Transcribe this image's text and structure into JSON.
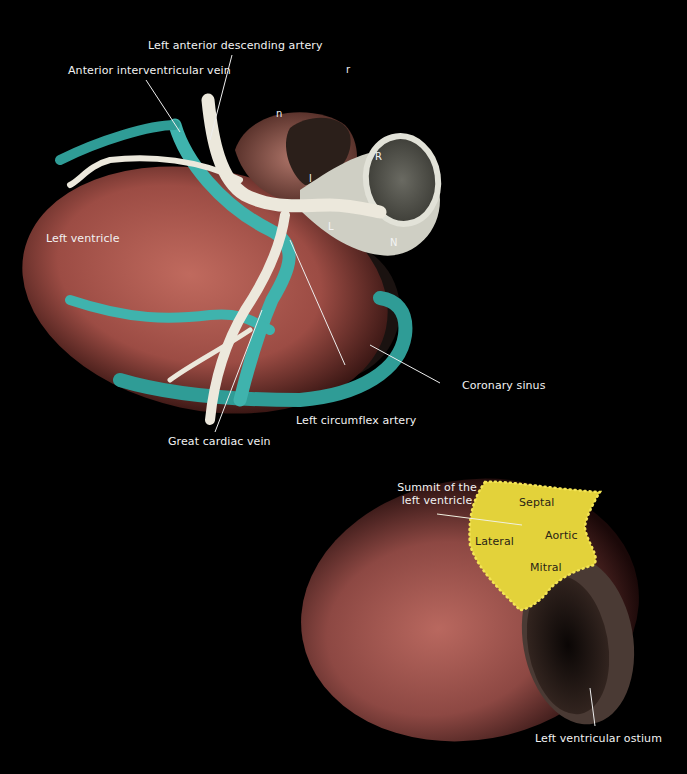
{
  "figure": {
    "top_view": {
      "labels": {
        "lad": "Left anterior descending artery",
        "aiv": "Anterior interventricular vein",
        "lv": "Left ventricle",
        "cs": "Coronary sinus",
        "lcx": "Left circumflex artery",
        "gcv": "Great cardiac vein"
      },
      "letters": {
        "r_small": "r",
        "n_small": "n",
        "l_small": "l",
        "R": "R",
        "L": "L",
        "N": "N"
      }
    },
    "bottom_view": {
      "labels": {
        "summit_line1": "Summit of the",
        "summit_line2": "left ventricle",
        "septal": "Septal",
        "aortic": "Aortic",
        "lateral": "Lateral",
        "mitral": "Mitral",
        "ostium": "Left ventricular ostium"
      }
    },
    "colors": {
      "background": "#000000",
      "myocardium": "#a85a50",
      "vein": "#3fb3ad",
      "artery": "#ece8dc",
      "aortic_root": "#cfcfc4",
      "summit": "#e3d23a",
      "label_text": "#f2f2f2"
    }
  }
}
